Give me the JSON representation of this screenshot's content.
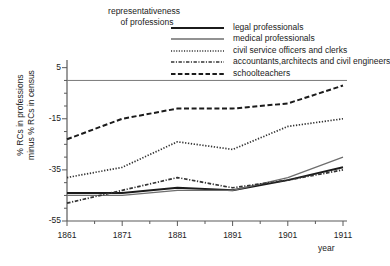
{
  "chart_data": {
    "type": "line",
    "title": "representativeness of professions",
    "title_lines": [
      "representativeness",
      "of professions"
    ],
    "xlabel": "year",
    "ylabel": "% RCs in professions minus % RCs in census",
    "ylabel_lines": [
      "% RCs in professions",
      "minus % RCs in census"
    ],
    "x": [
      1861,
      1871,
      1881,
      1891,
      1901,
      1911
    ],
    "xticks": [
      1861,
      1871,
      1881,
      1891,
      1901,
      1911
    ],
    "xtick_labels": [
      "1861",
      "1871",
      "1881",
      "1891",
      "1901",
      "1911"
    ],
    "yticks": [
      5,
      -15,
      -35,
      -55
    ],
    "ytick_labels": [
      "5",
      "-15",
      "-35",
      "-55"
    ],
    "xlim": [
      1861,
      1911
    ],
    "ylim": [
      -55,
      8
    ],
    "grid": false,
    "zero_line": true,
    "legend_position": "top-right",
    "series": [
      {
        "name": "legal professionals",
        "style": "solid-thick",
        "color": "#1b1b1b",
        "values": [
          -44,
          -44,
          -42,
          -43,
          -39,
          -34
        ]
      },
      {
        "name": "medical professionals",
        "style": "solid-thin",
        "color": "#6e6e6e",
        "values": [
          -45,
          -45,
          -43,
          -43,
          -38,
          -30
        ]
      },
      {
        "name": "civil service officers and clerks",
        "style": "dotted",
        "color": "#333333",
        "values": [
          -38,
          -34,
          -24,
          -27,
          -18,
          -15
        ]
      },
      {
        "name": "accountants,architects and civil engineers",
        "style": "dash-dot",
        "color": "#333333",
        "values": [
          -48,
          -43,
          -38,
          -42,
          -39,
          -35
        ]
      },
      {
        "name": "schoolteachers",
        "style": "dashed",
        "color": "#1b1b1b",
        "values": [
          -23,
          -15,
          -11,
          -11,
          -9,
          -2
        ]
      }
    ]
  }
}
